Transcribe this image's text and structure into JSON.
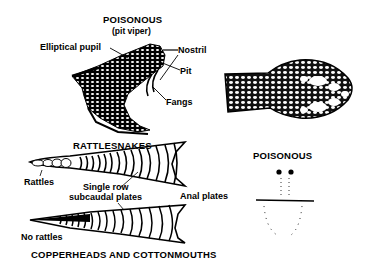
{
  "head_side_view": {
    "title": "POISONOUS",
    "subtitle": "(pit viper)",
    "labels": {
      "elliptical_pupil": "Elliptical pupil",
      "nostril": "Nostril",
      "pit": "Pit",
      "fangs": "Fangs"
    }
  },
  "tail_rattlesnake": {
    "title": "RATTLESNAKES",
    "labels": {
      "rattles": "Rattles",
      "single_row_line1": "Single row",
      "single_row_line2": "subcaudal plates",
      "anal_plates": "Anal plates"
    }
  },
  "tail_copperhead": {
    "title": "COPPERHEADS AND COTTONMOUTHS",
    "labels": {
      "no_rattles": "No rattles"
    }
  },
  "bite_pattern": {
    "title": "POISONOUS"
  }
}
